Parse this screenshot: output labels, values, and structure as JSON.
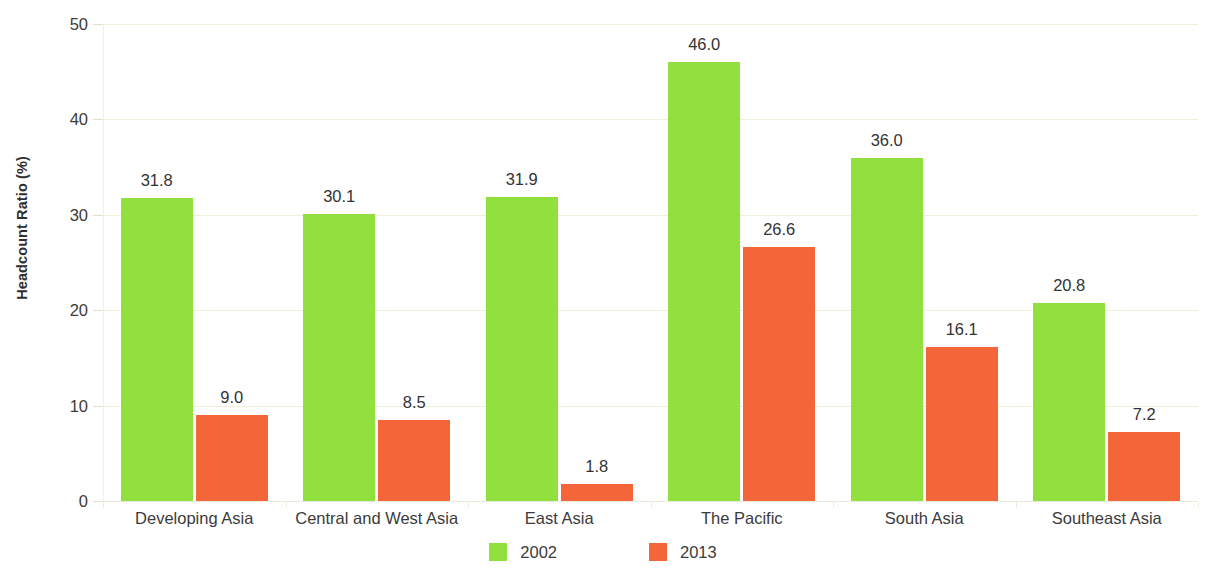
{
  "chart_data": {
    "type": "bar",
    "title": "",
    "subtitle": "",
    "xlabel": "",
    "ylabel": "Headcount Ratio (%)",
    "ylim": [
      0,
      50
    ],
    "yticks": [
      "0",
      "10",
      "20",
      "30",
      "40",
      "50"
    ],
    "ytick_values": [
      0,
      10,
      20,
      30,
      40,
      50
    ],
    "grid": true,
    "legend_position": "bottom-center",
    "categories": [
      "Developing Asia",
      "Central and West Asia",
      "East Asia",
      "The Pacific",
      "South Asia",
      "Southeast Asia"
    ],
    "series": [
      {
        "name": "2002",
        "color": "#92e03e",
        "values": [
          31.8,
          30.1,
          31.9,
          46.0,
          36.0,
          20.8
        ],
        "labels": [
          "31.8",
          "30.1",
          "31.9",
          "46.0",
          "36.0",
          "20.8"
        ]
      },
      {
        "name": "2013",
        "color": "#f4663a",
        "values": [
          9.0,
          8.5,
          1.8,
          26.6,
          16.1,
          7.2
        ],
        "labels": [
          "9.0",
          "8.5",
          "1.8",
          "26.6",
          "16.1",
          "7.2"
        ]
      }
    ]
  },
  "colors": {
    "series_2002": "#92e03e",
    "series_2013": "#f4663a",
    "gridline": "#f0efd6",
    "text": "#3b3b3b",
    "background": "#ffffff"
  },
  "legend": {
    "items": [
      {
        "label": "2002",
        "color": "#92e03e"
      },
      {
        "label": "2013",
        "color": "#f4663a"
      }
    ]
  }
}
